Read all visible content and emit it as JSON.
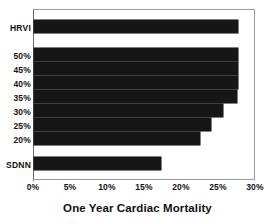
{
  "chart_data": {
    "type": "bar",
    "orientation": "horizontal",
    "title": "",
    "xlabel": "One Year Cardiac Mortality",
    "ylabel": "",
    "xlim": [
      0,
      30
    ],
    "xunit": "%",
    "xticks": [
      "0%",
      "5%",
      "10%",
      "15%",
      "20%",
      "25%",
      "30%"
    ],
    "xtick_values": [
      0,
      5,
      10,
      15,
      20,
      25,
      30
    ],
    "grid": false,
    "legend": false,
    "bar_color": "#161616",
    "frame_color": "#9a9a9a",
    "categories": [
      "HRVI",
      "50%",
      "45%",
      "40%",
      "35%",
      "30%",
      "25%",
      "20%",
      "SDNN"
    ],
    "values": [
      27.7,
      27.7,
      27.7,
      27.7,
      27.6,
      25.6,
      24.0,
      22.5,
      17.2
    ],
    "groups": [
      {
        "name": "HRVI",
        "categories": [
          "HRVI"
        ],
        "values": [
          27.7
        ]
      },
      {
        "name": "ejection-fraction-cutoffs",
        "categories": [
          "50%",
          "45%",
          "40%",
          "35%",
          "30%",
          "25%",
          "20%"
        ],
        "values": [
          27.7,
          27.7,
          27.7,
          27.6,
          25.6,
          24.0,
          22.5
        ]
      },
      {
        "name": "SDNN",
        "categories": [
          "SDNN"
        ],
        "values": [
          17.2
        ]
      }
    ]
  }
}
